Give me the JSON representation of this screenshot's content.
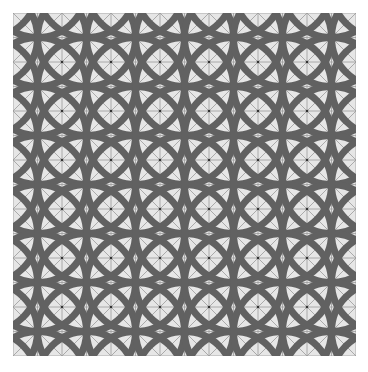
{
  "image": {
    "description": "Seamless geometric tile pattern of overlapping circles with grid and diagonal lines",
    "width": 368,
    "height": 372
  },
  "pattern": {
    "origin": [
      13,
      13
    ],
    "size": 343,
    "cell": 49,
    "columns": 7,
    "rows": 7,
    "circle_radius": 49,
    "circle_stroke_width": 7,
    "colors": {
      "page_background": "#ffffff",
      "tile_background": "#e6e6e6",
      "circle_stroke": "#616161",
      "grid_line": "#9a9a9a",
      "dot": "#333333"
    }
  }
}
